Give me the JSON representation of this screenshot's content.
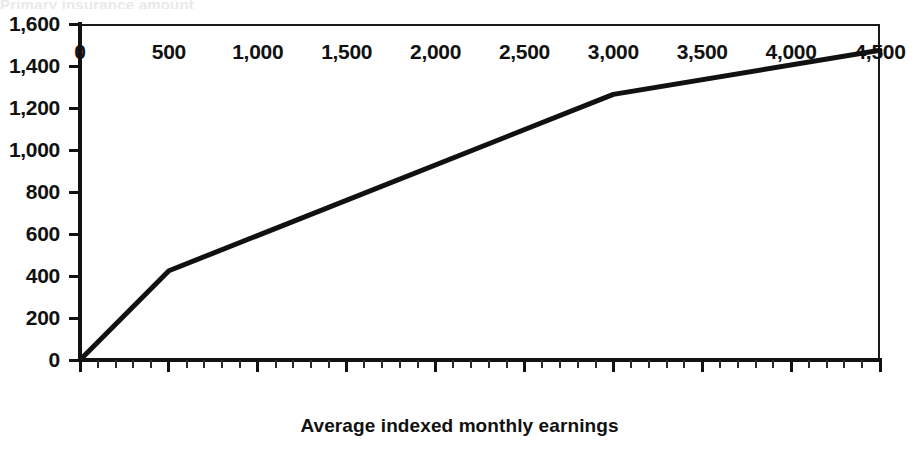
{
  "chart_data": {
    "type": "line",
    "title": "",
    "xlabel": "Average indexed monthly earnings",
    "ylabel": "",
    "xlim": [
      0,
      4500
    ],
    "ylim": [
      0,
      1600
    ],
    "grid": false,
    "legend": null,
    "x_major_step": 500,
    "x_minor_step": 100,
    "y_major_step": 200,
    "line_color": "#111111",
    "x_tick_labels": [
      "0",
      "500",
      "1,000",
      "1,500",
      "2,000",
      "2,500",
      "3,000",
      "3,500",
      "4,000",
      "4,500"
    ],
    "x_tick_values": [
      0,
      500,
      1000,
      1500,
      2000,
      2500,
      3000,
      3500,
      4000,
      4500
    ],
    "y_tick_labels": [
      "0",
      "200",
      "400",
      "600",
      "800",
      "1,000",
      "1,200",
      "1,400",
      "1,600"
    ],
    "y_tick_values": [
      0,
      200,
      400,
      600,
      800,
      1000,
      1200,
      1400,
      1600
    ],
    "series": [
      {
        "name": "Monthly benefit",
        "x": [
          0,
          500,
          3000,
          4500
        ],
        "values": [
          0,
          425,
          1265,
          1475
        ]
      }
    ]
  },
  "figure": {
    "clipped_top_text": "Primary insurance amount"
  }
}
